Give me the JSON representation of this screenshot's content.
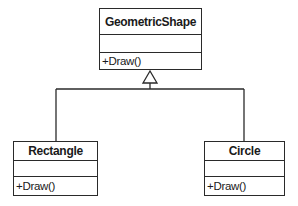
{
  "diagram": {
    "type": "uml-class-diagram",
    "relationship": "inheritance",
    "base_class": {
      "name": "GeometricShape",
      "attributes": [],
      "methods": [
        "+Draw()"
      ]
    },
    "derived_classes": [
      {
        "name": "Rectangle",
        "attributes": [],
        "methods": [
          "+Draw()"
        ]
      },
      {
        "name": "Circle",
        "attributes": [],
        "methods": [
          "+Draw()"
        ]
      }
    ],
    "colors": {
      "line": "#2a2a2a",
      "background": "#ffffff",
      "text": "#1a1a1a"
    }
  }
}
